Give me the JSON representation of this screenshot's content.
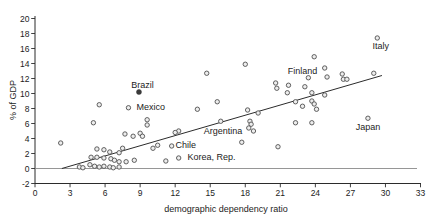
{
  "chart_data": {
    "type": "scatter",
    "title": "",
    "xlabel": "demographic dependency ratio",
    "ylabel": "% of GDP",
    "xlim": [
      0,
      33
    ],
    "ylim": [
      -2,
      20
    ],
    "x_tick_step": 3,
    "y_tick_step": 2,
    "x_ticks": [
      0,
      3,
      6,
      9,
      12,
      15,
      18,
      21,
      24,
      27,
      30,
      33
    ],
    "y_ticks": [
      -2,
      0,
      2,
      4,
      6,
      8,
      10,
      12,
      14,
      16,
      18,
      20
    ],
    "grid": false,
    "zero_line_y": 0,
    "trend_line": {
      "x1": 2.3,
      "y1": 0,
      "x2": 29.7,
      "y2": 12.4
    },
    "marker_style": {
      "fill": "#ededed",
      "stroke": "#4f4f4f",
      "radius": 2.2
    },
    "filled_marker_style": {
      "fill": "#3a3a3a",
      "stroke": "#3a3a3a",
      "radius": 2.5
    },
    "axis_color": "#2b2b2b",
    "zero_line_color": "#8a8a8a",
    "points": [
      [
        5.5,
        8.5
      ],
      [
        9.6,
        6.5
      ],
      [
        5.0,
        6.1
      ],
      [
        9.6,
        5.8
      ],
      [
        2.2,
        3.4
      ],
      [
        7.7,
        4.6
      ],
      [
        8.4,
        4.3
      ],
      [
        9.0,
        4.7
      ],
      [
        9.2,
        4.3
      ],
      [
        7.5,
        2.7
      ],
      [
        5.3,
        2.6
      ],
      [
        5.9,
        2.5
      ],
      [
        6.4,
        2.2
      ],
      [
        7.2,
        2.1
      ],
      [
        4.8,
        1.5
      ],
      [
        5.3,
        1.5
      ],
      [
        5.9,
        1.4
      ],
      [
        6.5,
        1.3
      ],
      [
        6.8,
        1.1
      ],
      [
        7.2,
        0.9
      ],
      [
        7.8,
        0.9
      ],
      [
        8.5,
        1.1
      ],
      [
        4.7,
        0.5
      ],
      [
        5.1,
        0.3
      ],
      [
        5.5,
        0.2
      ],
      [
        5.9,
        0.3
      ],
      [
        6.4,
        0.2
      ],
      [
        3.8,
        0.2
      ],
      [
        4.1,
        0.1
      ],
      [
        6.7,
        0.1
      ],
      [
        7.2,
        0.2
      ],
      [
        8.0,
        8.1
      ],
      [
        15.6,
        8.9
      ],
      [
        13.9,
        7.9
      ],
      [
        18.2,
        7.8
      ],
      [
        19.1,
        7.4
      ],
      [
        15.9,
        6.3
      ],
      [
        18.4,
        6.3
      ],
      [
        18.5,
        5.9
      ],
      [
        18.3,
        5.4
      ],
      [
        18.7,
        5.0
      ],
      [
        12.3,
        5.0
      ],
      [
        12.0,
        4.8
      ],
      [
        11.7,
        3.0
      ],
      [
        10.5,
        3.1
      ],
      [
        10.1,
        2.7
      ],
      [
        17.7,
        3.5
      ],
      [
        11.2,
        1.0
      ],
      [
        12.3,
        1.4
      ],
      [
        20.8,
        2.9
      ],
      [
        18.0,
        13.9
      ],
      [
        14.7,
        12.7
      ],
      [
        29.3,
        17.4
      ],
      [
        23.9,
        14.9
      ],
      [
        24.8,
        13.4
      ],
      [
        23.4,
        12.1
      ],
      [
        25.0,
        12.2
      ],
      [
        26.3,
        12.6
      ],
      [
        26.4,
        11.9
      ],
      [
        26.7,
        11.9
      ],
      [
        29.0,
        12.7
      ],
      [
        20.6,
        11.4
      ],
      [
        21.7,
        11.1
      ],
      [
        20.7,
        10.7
      ],
      [
        21.6,
        10.1
      ],
      [
        23.1,
        10.9
      ],
      [
        23.7,
        10.1
      ],
      [
        24.8,
        9.8
      ],
      [
        23.7,
        9.0
      ],
      [
        22.3,
        8.9
      ],
      [
        22.9,
        8.3
      ],
      [
        23.9,
        8.6
      ],
      [
        24.1,
        7.9
      ],
      [
        22.3,
        6.1
      ],
      [
        23.7,
        6.1
      ],
      [
        28.5,
        6.7
      ]
    ],
    "filled_points": [
      [
        8.9,
        10.2
      ]
    ],
    "annotations": [
      {
        "text": "Brazil",
        "x": 9.2,
        "y": 11.1
      },
      {
        "text": "Mexico",
        "x": 9.9,
        "y": 8.25
      },
      {
        "text": "Chile",
        "x": 12.9,
        "y": 3.15
      },
      {
        "text": "Korea, Rep.",
        "x": 15.1,
        "y": 1.5
      },
      {
        "text": "Argentina",
        "x": 16.1,
        "y": 5.0
      },
      {
        "text": "Finland",
        "x": 22.9,
        "y": 13.0
      },
      {
        "text": "Italy",
        "x": 29.6,
        "y": 16.3
      },
      {
        "text": "Japan",
        "x": 28.5,
        "y": 5.5
      }
    ]
  }
}
